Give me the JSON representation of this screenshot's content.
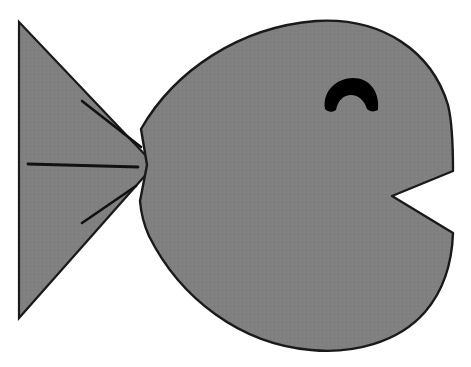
{
  "image": {
    "title": "Fish clipart",
    "width": 471,
    "height": 367,
    "background_color": "#ffffff",
    "body_fill_color": "#808080",
    "outline_color": "#1a1a1a",
    "eye_color": "#000000",
    "fin_line_color": "#111111",
    "alt_text": "Gray silhouette of a cartoon fish facing right with a triangular tail, three fin lines, a crescent eye and a V-shaped notched mouth"
  },
  "shapes": {
    "tail": {
      "name": "tail-fin",
      "description": "Triangular tail on the left side",
      "points": "19,22 19,318 150,170 150,160"
    },
    "body": {
      "name": "fish-body",
      "description": "Large rounded body with a V notch mouth on the right",
      "path": "M 141,129 C 175,70 240,27 316,21 C 383,17 432,52 448,105 C 452,121 453,147 453,171 L 392,196 L 453,233 C 452,262 444,290 425,312 C 398,343 352,354 311,350 C 240,344 180,298 149,236 C 144,225 141,213 140,201 L 147,165 Z"
    },
    "eye": {
      "name": "fish-eye",
      "description": "Black crescent dome eye with a concave notch at the bottom",
      "path": "M 325,109 C 322,90 338,78 353,78 C 369,78 380,91 378,110 C 374,112 370,112 367,109 C 364,99 357,95 351,95 C 344,95 338,100 336,110 C 332,113 328,112 325,109 Z"
    },
    "fin_lines": [
      {
        "name": "fin-line-upper",
        "x1": 82,
        "y1": 101,
        "x2": 141,
        "y2": 147
      },
      {
        "name": "fin-line-middle",
        "x1": 28,
        "y1": 164,
        "x2": 138,
        "y2": 167
      },
      {
        "name": "fin-line-lower",
        "x1": 82,
        "y1": 223,
        "x2": 136,
        "y2": 186
      }
    ]
  }
}
